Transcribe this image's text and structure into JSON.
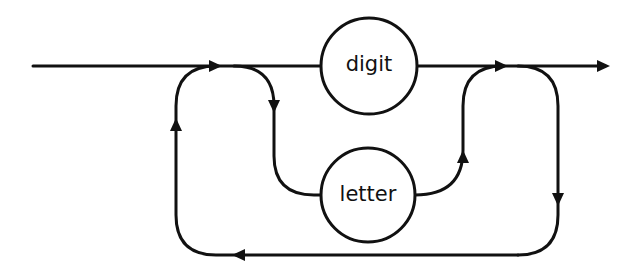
{
  "diagram": {
    "type": "syntax-diagram",
    "nodes": [
      {
        "id": "digit",
        "label": "digit",
        "shape": "circle"
      },
      {
        "id": "letter",
        "label": "letter",
        "shape": "circle"
      }
    ],
    "edges": [
      {
        "from": "start",
        "to": "digit"
      },
      {
        "from": "start",
        "to": "letter"
      },
      {
        "from": "digit",
        "to": "end"
      },
      {
        "from": "letter",
        "to": "end"
      },
      {
        "from": "end",
        "to": "start",
        "label": "repeat loop"
      }
    ],
    "colors": {
      "stroke": "#111111",
      "background": "#ffffff"
    }
  }
}
